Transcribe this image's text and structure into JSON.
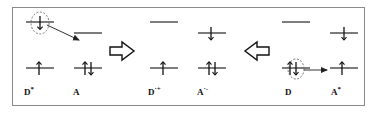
{
  "figure": {
    "border_color": "#8a8a8a",
    "background": "#ffffff",
    "ink_color": "#111111",
    "highlight_color": "#555555"
  },
  "panels": [
    {
      "id": "panel-left",
      "species": [
        {
          "id": "d-star",
          "label": "D",
          "superscript": "*",
          "label_x": 24,
          "label_y": 88,
          "levels": [
            {
              "id": "d-star-lumo",
              "x": 26,
              "y": 22,
              "width": 28,
              "electrons": [
                "up"
              ],
              "circled": true
            },
            {
              "id": "d-star-homo",
              "x": 26,
              "y": 68,
              "width": 28,
              "electrons": [
                "up"
              ],
              "circled": false
            }
          ]
        },
        {
          "id": "a-ground",
          "label": "A",
          "superscript": "",
          "label_x": 73,
          "label_y": 88,
          "levels": [
            {
              "id": "a-lumo",
              "x": 74,
              "y": 33,
              "width": 28,
              "electrons": [],
              "circled": false
            },
            {
              "id": "a-homo",
              "x": 74,
              "y": 68,
              "width": 28,
              "electrons": [
                "up",
                "down"
              ],
              "circled": false
            }
          ]
        }
      ]
    },
    {
      "id": "panel-middle",
      "species": [
        {
          "id": "d-cation",
          "label": "D",
          "superscript": "·+",
          "label_x": 148,
          "label_y": 88,
          "levels": [
            {
              "id": "d-cation-lumo",
              "x": 150,
              "y": 22,
              "width": 28,
              "electrons": [],
              "circled": false
            },
            {
              "id": "d-cation-homo",
              "x": 150,
              "y": 68,
              "width": 28,
              "electrons": [
                "up"
              ],
              "circled": false
            }
          ]
        },
        {
          "id": "a-anion",
          "label": "A",
          "superscript": "·-",
          "label_x": 197,
          "label_y": 88,
          "levels": [
            {
              "id": "a-anion-lumo",
              "x": 198,
              "y": 33,
              "width": 28,
              "electrons": [
                "up"
              ],
              "circled": false
            },
            {
              "id": "a-anion-homo",
              "x": 198,
              "y": 68,
              "width": 28,
              "electrons": [
                "up",
                "down"
              ],
              "circled": false
            }
          ]
        }
      ]
    },
    {
      "id": "panel-right",
      "species": [
        {
          "id": "d-ground",
          "label": "D",
          "superscript": "",
          "label_x": 285,
          "label_y": 88,
          "levels": [
            {
              "id": "d-ground-lumo",
              "x": 282,
              "y": 22,
              "width": 28,
              "electrons": [],
              "circled": false
            },
            {
              "id": "d-ground-homo",
              "x": 282,
              "y": 68,
              "width": 28,
              "electrons": [
                "up",
                "down"
              ],
              "circled": true
            }
          ]
        },
        {
          "id": "a-star",
          "label": "A",
          "superscript": "*",
          "label_x": 331,
          "label_y": 88,
          "levels": [
            {
              "id": "a-star-lumo",
              "x": 330,
              "y": 33,
              "width": 28,
              "electrons": [
                "down"
              ],
              "circled": false
            },
            {
              "id": "a-star-homo",
              "x": 330,
              "y": 68,
              "width": 28,
              "electrons": [
                "up"
              ],
              "circled": false
            }
          ]
        }
      ]
    }
  ],
  "transfer_arrows": [
    {
      "id": "transfer-arrow-left",
      "from_x": 46,
      "from_y": 26,
      "to_x": 80,
      "to_y": 40,
      "description": "electron transfer from excited donor LUMO to acceptor LUMO"
    },
    {
      "id": "transfer-arrow-right",
      "from_x": 300,
      "from_y": 70,
      "to_x": 327,
      "to_y": 70,
      "description": "electron transfer from donor HOMO to excited acceptor HOMO"
    }
  ],
  "reaction_arrows": [
    {
      "id": "forward-block-arrow",
      "direction": "right",
      "x": 110,
      "y": 42,
      "width": 26,
      "height": 18
    },
    {
      "id": "reverse-block-arrow",
      "direction": "left",
      "x": 243,
      "y": 42,
      "width": 26,
      "height": 18
    }
  ],
  "highlight_ellipses": [
    {
      "id": "highlight-ellipse-left",
      "cx": 40,
      "cy": 23,
      "rx": 9,
      "ry": 11
    },
    {
      "id": "highlight-ellipse-right",
      "cx": 296,
      "cy": 69,
      "rx": 8,
      "ry": 10
    }
  ]
}
